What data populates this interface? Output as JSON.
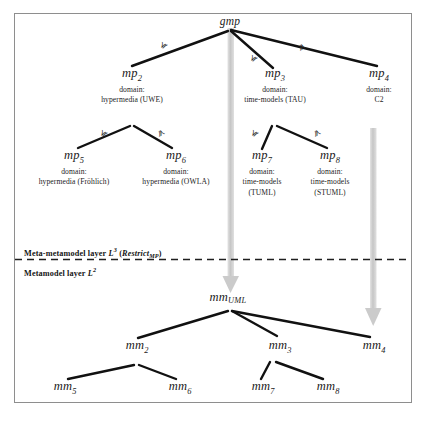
{
  "figure": {
    "border_color": "#8e8e8e",
    "edge_color": "#111111",
    "arrow_color": "#c9c9c9",
    "relation_symbol": "≼"
  },
  "layers": {
    "upper": {
      "label_prefix": "Meta-metamodel layer",
      "layer_symbol": "L",
      "layer_exponent": "3",
      "qualifier_open": "(",
      "qualifier_name": "Restrict",
      "qualifier_sub": "MP",
      "qualifier_close": ")"
    },
    "lower": {
      "label_prefix": "Metamodel layer",
      "layer_symbol": "L",
      "layer_exponent": "2"
    }
  },
  "upper_nodes": [
    {
      "id": "gmp",
      "name": "gmp",
      "subscript": "",
      "domain_label": "",
      "domain_value": "",
      "domain_value2": ""
    },
    {
      "id": "mp2",
      "name": "mp",
      "subscript": "2",
      "domain_label": "domain:",
      "domain_value": "hypermedia (UWE)",
      "domain_value2": ""
    },
    {
      "id": "mp3",
      "name": "mp",
      "subscript": "3",
      "domain_label": "domain:",
      "domain_value": "time-models (TAU)",
      "domain_value2": ""
    },
    {
      "id": "mp4",
      "name": "mp",
      "subscript": "4",
      "domain_label": "domain:",
      "domain_value": "C2",
      "domain_value2": ""
    },
    {
      "id": "mp5",
      "name": "mp",
      "subscript": "5",
      "domain_label": "domain:",
      "domain_value": "hypermedia (Fröhlich)",
      "domain_value2": ""
    },
    {
      "id": "mp6",
      "name": "mp",
      "subscript": "6",
      "domain_label": "domain:",
      "domain_value": "hypermedia (OWLA)",
      "domain_value2": ""
    },
    {
      "id": "mp7",
      "name": "mp",
      "subscript": "7",
      "domain_label": "domain:",
      "domain_value": "time-models",
      "domain_value2": "(TUML)"
    },
    {
      "id": "mp8",
      "name": "mp",
      "subscript": "8",
      "domain_label": "domain:",
      "domain_value": "time-models",
      "domain_value2": "(STUML)"
    }
  ],
  "lower_nodes": [
    {
      "id": "mmUML",
      "name": "mm",
      "subscript": "UML"
    },
    {
      "id": "mm2",
      "name": "mm",
      "subscript": "2"
    },
    {
      "id": "mm3",
      "name": "mm",
      "subscript": "3"
    },
    {
      "id": "mm4",
      "name": "mm",
      "subscript": "4"
    },
    {
      "id": "mm5",
      "name": "mm",
      "subscript": "5"
    },
    {
      "id": "mm6",
      "name": "mm",
      "subscript": "6"
    },
    {
      "id": "mm7",
      "name": "mm",
      "subscript": "7"
    },
    {
      "id": "mm8",
      "name": "mm",
      "subscript": "8"
    }
  ],
  "edge_labels": {
    "gmp_mp2": "≼",
    "gmp_mp3": "≼",
    "gmp_mp4": "≼",
    "mp2_mp5": "≼",
    "mp2_mp6": "≼",
    "mp3_mp7": "≼",
    "mp3_mp8": "≼"
  },
  "refinement_arrows": [
    {
      "id": "gmp-to-mmUML",
      "from": "gmp",
      "to": "mmUML"
    },
    {
      "id": "mp4-to-mm4",
      "from": "mp4",
      "to": "mm4"
    }
  ]
}
